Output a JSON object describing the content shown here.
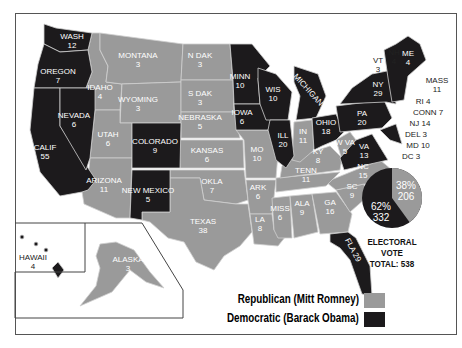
{
  "colors": {
    "republican": "#9a9a9a",
    "democratic": "#1c1a1c",
    "border": "#cfcfcf"
  },
  "legend": {
    "republican": "Republican (Mitt Romney)",
    "democratic": "Democratic (Barack Obama)"
  },
  "electoral": {
    "line1": "ELECTORAL",
    "line2": "VOTE",
    "line3": "TOTAL: 538",
    "rep_pct": "38%",
    "rep_votes": "206",
    "dem_pct": "62%",
    "dem_votes": "332"
  },
  "states": [
    {
      "id": "wa",
      "name": "WASH",
      "votes": "12",
      "party": "D",
      "x": 72,
      "y": 41
    },
    {
      "id": "or",
      "name": "OREGON",
      "votes": "7",
      "party": "D",
      "x": 58,
      "y": 76
    },
    {
      "id": "ca",
      "name": "CALIF",
      "votes": "55",
      "party": "D",
      "x": 45,
      "y": 152
    },
    {
      "id": "nv",
      "name": "NEVADA",
      "votes": "6",
      "party": "D",
      "x": 74,
      "y": 120
    },
    {
      "id": "id",
      "name": "IDAHO",
      "votes": "4",
      "party": "R",
      "x": 100,
      "y": 92
    },
    {
      "id": "mt",
      "name": "MONTANA",
      "votes": "3",
      "party": "R",
      "x": 138,
      "y": 60
    },
    {
      "id": "wy",
      "name": "WYOMING",
      "votes": "3",
      "party": "R",
      "x": 138,
      "y": 104
    },
    {
      "id": "ut",
      "name": "UTAH",
      "votes": "6",
      "party": "R",
      "x": 108,
      "y": 139
    },
    {
      "id": "co",
      "name": "COLORADO",
      "votes": "9",
      "party": "D",
      "x": 155,
      "y": 146
    },
    {
      "id": "az",
      "name": "ARIZONA",
      "votes": "11",
      "party": "R",
      "x": 104,
      "y": 185
    },
    {
      "id": "nm",
      "name": "NEW MEXICO",
      "votes": "5",
      "party": "D",
      "x": 148,
      "y": 195
    },
    {
      "id": "nd",
      "name": "N DAK",
      "votes": "3",
      "party": "R",
      "x": 200,
      "y": 60
    },
    {
      "id": "sd",
      "name": "S DAK",
      "votes": "3",
      "party": "R",
      "x": 200,
      "y": 98
    },
    {
      "id": "ne",
      "name": "NEBRASKA",
      "votes": "5",
      "party": "R",
      "x": 200,
      "y": 122
    },
    {
      "id": "ks",
      "name": "KANSAS",
      "votes": "6",
      "party": "R",
      "x": 207,
      "y": 155
    },
    {
      "id": "ok",
      "name": "OKLA",
      "votes": "7",
      "party": "R",
      "x": 212,
      "y": 186
    },
    {
      "id": "tx",
      "name": "TEXAS",
      "votes": "38",
      "party": "R",
      "x": 203,
      "y": 226
    },
    {
      "id": "mn",
      "name": "MINN",
      "votes": "10",
      "party": "D",
      "x": 240,
      "y": 81
    },
    {
      "id": "ia",
      "name": "IOWA",
      "votes": "6",
      "party": "D",
      "x": 242,
      "y": 117
    },
    {
      "id": "mo",
      "name": "MO",
      "votes": "10",
      "party": "R",
      "x": 257,
      "y": 154
    },
    {
      "id": "ar",
      "name": "ARK",
      "votes": "6",
      "party": "R",
      "x": 258,
      "y": 192
    },
    {
      "id": "la",
      "name": "LA",
      "votes": "8",
      "party": "R",
      "x": 260,
      "y": 224
    },
    {
      "id": "wi",
      "name": "WIS",
      "votes": "10",
      "party": "D",
      "x": 273,
      "y": 94
    },
    {
      "id": "il",
      "name": "ILL",
      "votes": "20",
      "party": "D",
      "x": 283,
      "y": 140
    },
    {
      "id": "mi",
      "name": "MICHIGAN 16",
      "votes": "",
      "party": "D",
      "x": 312,
      "y": 94,
      "rot": 48
    },
    {
      "id": "in",
      "name": "IN",
      "votes": "11",
      "party": "R",
      "x": 303,
      "y": 136
    },
    {
      "id": "oh",
      "name": "OHIO",
      "votes": "18",
      "party": "D",
      "x": 326,
      "y": 127
    },
    {
      "id": "ky",
      "name": "KY",
      "votes": "8",
      "party": "R",
      "x": 318,
      "y": 156
    },
    {
      "id": "tn",
      "name": "TENN",
      "votes": "11",
      "party": "R",
      "x": 306,
      "y": 175
    },
    {
      "id": "ms",
      "name": "MISS",
      "votes": "6",
      "party": "R",
      "x": 280,
      "y": 213
    },
    {
      "id": "al",
      "name": "ALA",
      "votes": "9",
      "party": "R",
      "x": 302,
      "y": 208
    },
    {
      "id": "ga",
      "name": "GA",
      "votes": "16",
      "party": "R",
      "x": 330,
      "y": 207
    },
    {
      "id": "fl",
      "name": "FLA 29",
      "votes": "",
      "party": "D",
      "x": 353,
      "y": 250,
      "rot": 62
    },
    {
      "id": "sc",
      "name": "SC",
      "votes": "9",
      "party": "R",
      "x": 352,
      "y": 191
    },
    {
      "id": "nc",
      "name": "NC",
      "votes": "15",
      "party": "R",
      "x": 363,
      "y": 171
    },
    {
      "id": "va",
      "name": "VA",
      "votes": "13",
      "party": "D",
      "x": 364,
      "y": 151
    },
    {
      "id": "wv",
      "name": "W VA",
      "votes": "5",
      "party": "R",
      "x": 345,
      "y": 147
    },
    {
      "id": "pa",
      "name": "PA",
      "votes": "20",
      "party": "D",
      "x": 362,
      "y": 118
    },
    {
      "id": "ny",
      "name": "NY",
      "votes": "29",
      "party": "D",
      "x": 378,
      "y": 89
    },
    {
      "id": "me",
      "name": "ME",
      "votes": "4",
      "party": "D",
      "x": 408,
      "y": 58
    },
    {
      "id": "tx_dummy",
      "name": "",
      "votes": "",
      "party": "R",
      "x": 0,
      "y": 0
    },
    {
      "id": "ak",
      "name": "ALASKA",
      "votes": "3",
      "party": "R",
      "x": 128,
      "y": 264
    },
    {
      "id": "hi",
      "name": "HAWAII",
      "votes": "4",
      "party": "D",
      "x": 33,
      "y": 262,
      "dark_text": true
    }
  ],
  "callouts": [
    {
      "id": "vt",
      "name": "VT",
      "votes": "3",
      "x": 378,
      "y": 65
    },
    {
      "id": "nh",
      "name": "NH",
      "votes": "4",
      "x": 394,
      "y": 57
    },
    {
      "id": "ma",
      "name": "MASS",
      "votes": "11",
      "x": 437,
      "y": 85
    },
    {
      "id": "ri",
      "name": "RI 4",
      "votes": "",
      "x": 423,
      "y": 101
    },
    {
      "id": "ct",
      "name": "CONN 7",
      "votes": "",
      "x": 428,
      "y": 112
    },
    {
      "id": "nj",
      "name": "NJ 14",
      "votes": "",
      "x": 420,
      "y": 123
    },
    {
      "id": "de",
      "name": "DEL 3",
      "votes": "",
      "x": 416,
      "y": 134
    },
    {
      "id": "md",
      "name": "MD 10",
      "votes": "",
      "x": 418,
      "y": 145
    },
    {
      "id": "dc",
      "name": "DC 3",
      "votes": "",
      "x": 411,
      "y": 156
    }
  ]
}
